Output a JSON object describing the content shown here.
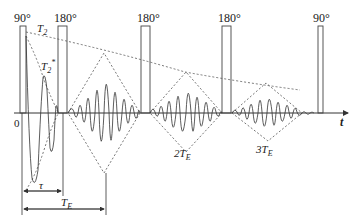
{
  "diagram": {
    "type": "CPMG spin-echo pulse sequence",
    "pulses": [
      {
        "label": "90°",
        "x": 20,
        "w": 6,
        "top": 26
      },
      {
        "label": "180°",
        "x": 58,
        "w": 9,
        "top": 26
      },
      {
        "label": "180°",
        "x": 141,
        "w": 9,
        "top": 26
      },
      {
        "label": "180°",
        "x": 222,
        "w": 9,
        "top": 26
      },
      {
        "label": "90°",
        "x": 318,
        "w": 5,
        "top": 26
      }
    ],
    "labels": {
      "t2": "T",
      "t2_sub": "2",
      "t2star": "T",
      "t2star_sub": "2",
      "t2star_sup": "*",
      "origin": "0",
      "axis": "t",
      "tau": "τ",
      "te": "T",
      "te_sub": "E",
      "echo2": "2T",
      "echo2_sub": "E",
      "echo3": "3T",
      "echo3_sub": "E"
    },
    "colors": {
      "line": "#333333",
      "dash": "#555555"
    }
  }
}
